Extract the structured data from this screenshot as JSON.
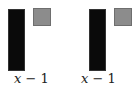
{
  "tiles": [
    {
      "bar": {
        "label_var": "x",
        "label_rest": " − 1",
        "color": "#0a0a0a"
      },
      "unit": {
        "color": "#8c8c8c"
      }
    },
    {
      "bar": {
        "label_var": "x",
        "label_rest": " − 1",
        "color": "#0a0a0a"
      },
      "unit": {
        "color": "#8c8c8c"
      }
    }
  ]
}
